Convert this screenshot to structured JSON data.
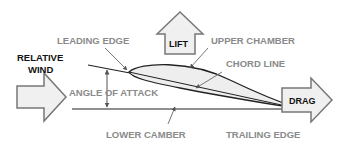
{
  "diagram": {
    "type": "airfoil-forces",
    "colors": {
      "label_gray": "#8a8a8a",
      "label_black": "#111111",
      "arrow_fill": "#f0f0f0",
      "arrow_stroke": "#777777",
      "airfoil_fill": "#eeeeee",
      "line": "#222222"
    },
    "labels": {
      "leading_edge": "LEADING EDGE",
      "lift": "LIFT",
      "upper_chamber": "UPPER CHAMBER",
      "chord_line": "CHORD LINE",
      "relative_wind_1": "RELATIVE",
      "relative_wind_2": "WIND",
      "angle_of_attack": "ANGLE OF ATTACK",
      "drag": "DRAG",
      "lower_camber": "LOWER CAMBER",
      "trailing_edge": "TRAILING EDGE"
    }
  }
}
